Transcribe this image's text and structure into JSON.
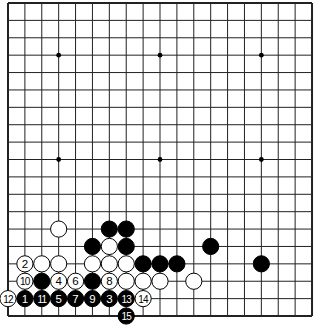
{
  "board": {
    "size": 19,
    "origin_x": 8,
    "origin_y": 3,
    "spacing_x": 16.89,
    "spacing_y": 17.39,
    "line_color": "#222222",
    "background": "#ffffff",
    "star_points": [
      [
        3,
        3
      ],
      [
        9,
        3
      ],
      [
        15,
        3
      ],
      [
        3,
        9
      ],
      [
        9,
        9
      ],
      [
        15,
        9
      ]
    ],
    "stones": [
      {
        "col": 3,
        "row": 13,
        "color": "white",
        "label": ""
      },
      {
        "col": 6,
        "row": 13,
        "color": "black",
        "label": ""
      },
      {
        "col": 7,
        "row": 13,
        "color": "black",
        "label": ""
      },
      {
        "col": 5,
        "row": 14,
        "color": "black",
        "label": ""
      },
      {
        "col": 6,
        "row": 14,
        "color": "white",
        "label": ""
      },
      {
        "col": 7,
        "row": 14,
        "color": "black",
        "label": ""
      },
      {
        "col": 12,
        "row": 14,
        "color": "black",
        "label": ""
      },
      {
        "col": 1,
        "row": 15,
        "color": "white",
        "label": "2"
      },
      {
        "col": 2,
        "row": 15,
        "color": "white",
        "label": ""
      },
      {
        "col": 3,
        "row": 15,
        "color": "white",
        "label": ""
      },
      {
        "col": 5,
        "row": 15,
        "color": "white",
        "label": ""
      },
      {
        "col": 6,
        "row": 15,
        "color": "white",
        "label": ""
      },
      {
        "col": 7,
        "row": 15,
        "color": "white",
        "label": ""
      },
      {
        "col": 8,
        "row": 15,
        "color": "black",
        "label": ""
      },
      {
        "col": 9,
        "row": 15,
        "color": "black",
        "label": ""
      },
      {
        "col": 10,
        "row": 15,
        "color": "black",
        "label": ""
      },
      {
        "col": 15,
        "row": 15,
        "color": "black",
        "label": ""
      },
      {
        "col": 1,
        "row": 16,
        "color": "white",
        "label": "10"
      },
      {
        "col": 2,
        "row": 16,
        "color": "black",
        "label": ""
      },
      {
        "col": 3,
        "row": 16,
        "color": "white",
        "label": "4"
      },
      {
        "col": 4,
        "row": 16,
        "color": "white",
        "label": "6"
      },
      {
        "col": 5,
        "row": 16,
        "color": "black",
        "label": ""
      },
      {
        "col": 6,
        "row": 16,
        "color": "white",
        "label": "8"
      },
      {
        "col": 7,
        "row": 16,
        "color": "white",
        "label": ""
      },
      {
        "col": 8,
        "row": 16,
        "color": "white",
        "label": ""
      },
      {
        "col": 9,
        "row": 16,
        "color": "white",
        "label": ""
      },
      {
        "col": 11,
        "row": 16,
        "color": "white",
        "label": ""
      },
      {
        "col": 0,
        "row": 17,
        "color": "white",
        "label": "12"
      },
      {
        "col": 1,
        "row": 17,
        "color": "black",
        "label": "1"
      },
      {
        "col": 2,
        "row": 17,
        "color": "black",
        "label": "11"
      },
      {
        "col": 3,
        "row": 17,
        "color": "black",
        "label": "5"
      },
      {
        "col": 4,
        "row": 17,
        "color": "black",
        "label": "7"
      },
      {
        "col": 5,
        "row": 17,
        "color": "black",
        "label": "9"
      },
      {
        "col": 6,
        "row": 17,
        "color": "black",
        "label": "3"
      },
      {
        "col": 7,
        "row": 17,
        "color": "black",
        "label": "13"
      },
      {
        "col": 8,
        "row": 17,
        "color": "white",
        "label": "14"
      },
      {
        "col": 7,
        "row": 18,
        "color": "black",
        "label": "15"
      }
    ]
  }
}
